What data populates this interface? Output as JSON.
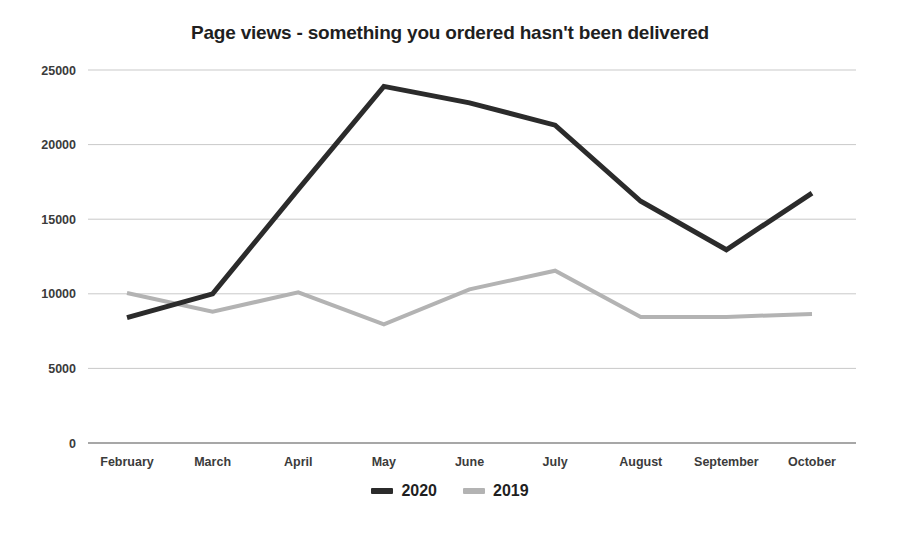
{
  "chart_data": {
    "type": "line",
    "title": "Page views - something you ordered hasn't been delivered",
    "xlabel": "",
    "ylabel": "",
    "categories": [
      "February",
      "March",
      "April",
      "May",
      "June",
      "July",
      "August",
      "September",
      "October"
    ],
    "series": [
      {
        "name": "2020",
        "color": "#2b2b2b",
        "line_width": 5,
        "values": [
          8400,
          10000,
          17000,
          23900,
          22800,
          21300,
          16200,
          12950,
          16750
        ]
      },
      {
        "name": "2019",
        "color": "#b3b3b3",
        "line_width": 4,
        "values": [
          10050,
          8800,
          10100,
          7950,
          10300,
          11550,
          8450,
          8450,
          8650
        ]
      }
    ],
    "ylim": [
      0,
      25000
    ],
    "y_ticks": [
      0,
      5000,
      10000,
      15000,
      20000,
      25000
    ],
    "y_tick_labels": [
      "0",
      "5000",
      "10000",
      "15000",
      "20000",
      "25000"
    ],
    "grid": true,
    "legend_position": "bottom"
  },
  "legend": {
    "items": [
      {
        "label": "2020",
        "color": "#2b2b2b"
      },
      {
        "label": "2019",
        "color": "#b3b3b3"
      }
    ]
  },
  "colors": {
    "background": "#ffffff",
    "gridline": "#c9c9c9",
    "axis": "#8a8a8a",
    "text": "#1f1f1f",
    "series_2020": "#2b2b2b",
    "series_2019": "#b3b3b3"
  }
}
